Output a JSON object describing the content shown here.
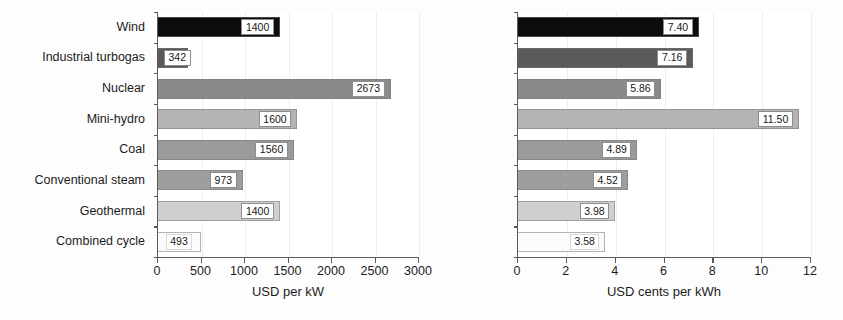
{
  "chart_data": [
    {
      "id": "capital-cost",
      "type": "bar",
      "orientation": "horizontal",
      "title": "",
      "xlabel": "USD per kW",
      "ylabel": "",
      "xlim": [
        0,
        3000
      ],
      "xticks": [
        0,
        500,
        1000,
        1500,
        2000,
        2500,
        3000
      ],
      "xticklabels": [
        "0",
        "500",
        "1000",
        "1500",
        "2000",
        "2500",
        "3000"
      ],
      "grid": true,
      "legend": "none",
      "categories": [
        "Wind",
        "Industrial turbogas",
        "Nuclear",
        "Mini-hydro",
        "Coal",
        "Conventional steam",
        "Geothermal",
        "Combined cycle"
      ],
      "values": [
        1400,
        342,
        2673,
        1600,
        1560,
        973,
        1400,
        493
      ],
      "value_labels": [
        "1400",
        "342",
        "2673",
        "1600",
        "1560",
        "973",
        "1400",
        "493"
      ],
      "bar_colors": [
        "#0d0d0d",
        "#5a5a5a",
        "#8a8a8a",
        "#b4b4b4",
        "#9a9a9a",
        "#9e9e9e",
        "#cfcfcf",
        "#fbfbfb"
      ]
    },
    {
      "id": "generation-cost",
      "type": "bar",
      "orientation": "horizontal",
      "title": "",
      "xlabel": "USD cents per kWh",
      "ylabel": "",
      "xlim": [
        0,
        12
      ],
      "xticks": [
        0,
        2,
        4,
        6,
        8,
        10,
        12
      ],
      "xticklabels": [
        "0",
        "2",
        "4",
        "6",
        "8",
        "10",
        "12"
      ],
      "grid": true,
      "legend": "none",
      "categories": [
        "Wind",
        "Industrial turbogas",
        "Nuclear",
        "Mini-hydro",
        "Coal",
        "Conventional steam",
        "Geothermal",
        "Combined cycle"
      ],
      "values": [
        7.4,
        7.16,
        5.86,
        11.5,
        4.89,
        4.52,
        3.98,
        3.58
      ],
      "value_labels": [
        "7.40",
        "7.16",
        "5.86",
        "11.50",
        "4.89",
        "4.52",
        "3.98",
        "3.58"
      ],
      "bar_colors": [
        "#0d0d0d",
        "#5a5a5a",
        "#8a8a8a",
        "#b4b4b4",
        "#9a9a9a",
        "#9e9e9e",
        "#cfcfcf",
        "#fbfbfb"
      ]
    }
  ]
}
